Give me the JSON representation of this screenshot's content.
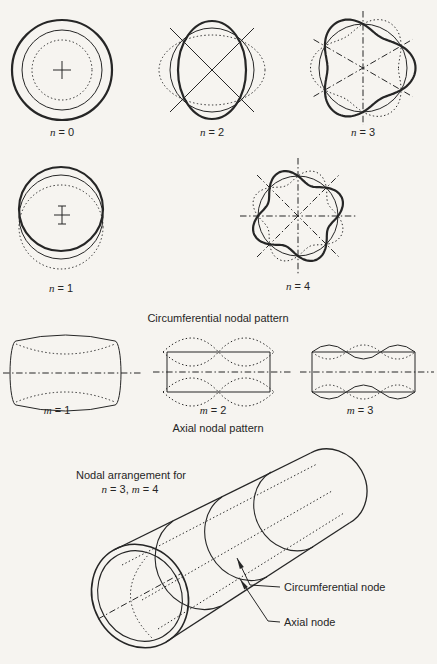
{
  "page": {
    "paper": "#f6f4f0",
    "ink": "#262626"
  },
  "circumferential": {
    "caption": "Circumferential nodal pattern",
    "modes": [
      {
        "var": "n",
        "rest": " = 0"
      },
      {
        "var": "n",
        "rest": " = 2"
      },
      {
        "var": "n",
        "rest": " = 3"
      },
      {
        "var": "n",
        "rest": " = 1"
      },
      {
        "var": "n",
        "rest": " = 4"
      }
    ]
  },
  "axial": {
    "caption": "Axial nodal pattern",
    "modes": [
      {
        "var": "m",
        "rest": " = 1"
      },
      {
        "var": "m",
        "rest": " = 2"
      },
      {
        "var": "m",
        "rest": " = 3"
      }
    ]
  },
  "arrangement": {
    "title_line1": "Nodal arrangement for",
    "title_line2": {
      "var1": "n",
      "mid": " = 3, ",
      "var2": "m",
      "tail": " = 4"
    },
    "callouts": {
      "circumferential": "Circumferential node",
      "axial": "Axial node"
    }
  }
}
